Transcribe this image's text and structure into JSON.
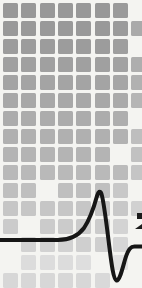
{
  "background_color": "#f4f4f1",
  "mosaic": {
    "origin_x": 3,
    "origin_y": 3,
    "pitch_x": 18.3,
    "pitch_y": 18,
    "square_size": 15,
    "rows": 16,
    "cols": 8,
    "cells": [
      [
        "#989898",
        "#989898",
        "#989898",
        "#989898",
        "#989898",
        "#989898",
        "#9a9a9a",
        null
      ],
      [
        "#999999",
        "#999999",
        "#999999",
        "#999999",
        "#999999",
        "#999999",
        "#9b9b9b",
        "#aaaaaa"
      ],
      [
        "#9c9c9c",
        "#9c9c9c",
        "#9c9c9c",
        "#9c9c9c",
        "#9c9c9c",
        "#9c9c9c",
        "#9e9e9e",
        null
      ],
      [
        "#a0a0a0",
        "#a0a0a0",
        "#a0a0a0",
        "#a0a0a0",
        "#a0a0a0",
        "#a0a0a0",
        "#a2a2a2",
        "#aeaeae"
      ],
      [
        "#a4a4a4",
        "#a4a4a4",
        "#a4a4a4",
        "#a4a4a4",
        "#a4a4a4",
        "#a4a4a4",
        "#a6a6a6",
        "#b1b1b1"
      ],
      [
        "#a8a8a8",
        "#a8a8a8",
        "#a8a8a8",
        "#a8a8a8",
        "#a8a8a8",
        "#a8a8a8",
        "#aaaaaa",
        "#b5b5b5"
      ],
      [
        "#acacac",
        "#acacac",
        "#acacac",
        "#acacac",
        "#acacac",
        "#acacac",
        "#aeaeae",
        null
      ],
      [
        "#b0b0b0",
        "#b0b0b0",
        "#b0b0b0",
        "#b0b0b0",
        "#b0b0b0",
        "#b0b0b0",
        "#b2b2b2",
        "#bebebe"
      ],
      [
        "#b4b4b4",
        "#b4b4b4",
        "#b4b4b4",
        "#b4b4b4",
        "#b4b4b4",
        "#b4b4b4",
        null,
        "#c1c1c1"
      ],
      [
        "#b9b9b9",
        "#b9b9b9",
        "#b9b9b9",
        "#b9b9b9",
        "#b9b9b9",
        "#b9b9b9",
        "#bbbbbb",
        "#c5c5c5"
      ],
      [
        "#bfbfbf",
        "#bfbfbf",
        null,
        "#bfbfbf",
        "#bfbfbf",
        "#bfbfbf",
        "#c8c8c8",
        null
      ],
      [
        "#c6c6c6",
        "#c6c6c6",
        "#c6c6c6",
        "#c6c6c6",
        "#c6c6c6",
        "#c6c6c6",
        "#c8c8c8",
        "#d1d1d1"
      ],
      [
        "#cbcbcb",
        null,
        "#cbcbcb",
        "#cbcbcb",
        "#cbcbcb",
        "#cbcbcb",
        "#d3d3d3",
        null
      ],
      [
        null,
        "#d2d2d2",
        "#d2d2d2",
        "#d2d2d2",
        "#cfcfcf",
        "#cfcfcf",
        "#d6d6d6",
        null
      ],
      [
        null,
        "#dcdcdc",
        "#dcdcdc",
        "#dcdcdc",
        "#dedede",
        null,
        "#e1e1e1",
        null
      ],
      [
        "#d7d7d7",
        "#d7d7d7",
        "#d7d7d7",
        "#d7d7d7",
        "#d7d7d7",
        "#d9d9d9",
        null,
        null
      ]
    ]
  },
  "waveform": {
    "shape": "action-potential-spike",
    "color": "#161616",
    "stroke_width": 4,
    "baseline_left_y": 240,
    "baseline_right_y": 246.5,
    "peak": {
      "x": 99.5,
      "y": 191
    },
    "trough": {
      "x": 116.5,
      "y": 280
    },
    "path": "M 0 240 L 58 240 C 70 240 78 236 84 228 C 90 219 94 207 97 196 C 98.5 191.5 100 190 101.5 194 C 104 202 106.5 224 109.5 248 C 111.5 264 113.5 279.5 116.5 280.5 C 119.5 281.5 122.5 268 125.5 258 C 128.5 248.5 131 246.5 134.5 246.5 L 142 246.5"
  },
  "edge_fragments": [
    {
      "x": 137,
      "y": 213,
      "w": 5,
      "h": 6,
      "color": "#1c1c1c",
      "wedge": false
    },
    {
      "x": 135,
      "y": 224,
      "w": 7,
      "h": 5,
      "color": "#1c1c1c",
      "wedge": true
    }
  ]
}
